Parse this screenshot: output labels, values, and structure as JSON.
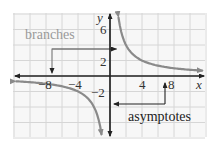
{
  "chart_data": {
    "type": "line",
    "title": "",
    "xlabel": "x",
    "ylabel": "y",
    "xlim": [
      -12,
      12
    ],
    "ylim": [
      -8,
      8
    ],
    "grid": true,
    "grid_step": 2,
    "x_ticks": [
      -8,
      -4,
      4,
      8
    ],
    "x_tick_labels": [
      "−8",
      "−4",
      "4",
      "8"
    ],
    "y_ticks": [
      6,
      2,
      -2
    ],
    "y_tick_labels": [
      "6",
      "2",
      "−2"
    ],
    "series": [
      {
        "name": "y = 8/x (right branch)",
        "x": [
          1.1,
          1.5,
          2,
          3,
          4,
          6,
          8,
          10,
          11.5
        ],
        "y": [
          7.3,
          5.33,
          4,
          2.67,
          2,
          1.33,
          1,
          0.8,
          0.7
        ]
      },
      {
        "name": "y = 8/x (left branch)",
        "x": [
          -12,
          -10,
          -8,
          -6,
          -4,
          -3,
          -2,
          -1.5,
          -1.1
        ],
        "y": [
          -0.67,
          -0.8,
          -1,
          -1.33,
          -2,
          -2.67,
          -4,
          -5.33,
          -7.3
        ]
      }
    ],
    "annotations": [
      {
        "text": "branches",
        "color": "#9a9a9a",
        "points_to": [
          "left branch",
          "right branch"
        ]
      },
      {
        "text": "asymptotes",
        "color": "#222222",
        "points_to": [
          "x-axis",
          "y-axis"
        ]
      }
    ],
    "colors": {
      "curve": "#8a8a8a",
      "axis": "#222222",
      "grid": "#d8d8d8",
      "background": "#f7f7f7"
    }
  },
  "labels": {
    "x_axis": "x",
    "y_axis": "y",
    "branches": "branches",
    "asymptotes": "asymptotes",
    "tick_x_m8": "−8",
    "tick_x_m4": "−4",
    "tick_x_4": "4",
    "tick_x_8": "8",
    "tick_y_6": "6",
    "tick_y_2": "2",
    "tick_y_m2": "−2"
  }
}
